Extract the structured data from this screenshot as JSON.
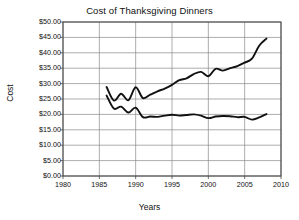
{
  "chart_data": {
    "type": "line",
    "title": "Cost of Thanksgiving Dinners",
    "xlabel": "Years",
    "ylabel": "Cost",
    "xlim": [
      1980,
      2010
    ],
    "ylim": [
      0,
      50
    ],
    "grid": true,
    "legend": "none",
    "xticks": [
      "1980",
      "1985",
      "1990",
      "1995",
      "2000",
      "2005",
      "2010"
    ],
    "xtick_values": [
      1980,
      1985,
      1990,
      1995,
      2000,
      2005,
      2010
    ],
    "yticks": [
      "$0.00",
      "$5.00",
      "$10.00",
      "$15.00",
      "$20.00",
      "$25.00",
      "$30.00",
      "$35.00",
      "$40.00",
      "$45.00",
      "$50.00"
    ],
    "ytick_values": [
      0,
      5,
      10,
      15,
      20,
      25,
      30,
      35,
      40,
      45,
      50
    ],
    "x": [
      1986,
      1987,
      1988,
      1989,
      1990,
      1991,
      1992,
      1993,
      1994,
      1995,
      1996,
      1997,
      1998,
      1999,
      2000,
      2001,
      2002,
      2003,
      2004,
      2005,
      2006,
      2007,
      2008
    ],
    "series": [
      {
        "name": "Nominal cost",
        "values": [
          28.9,
          24.5,
          26.7,
          24.6,
          28.8,
          25.3,
          26.4,
          27.5,
          28.4,
          29.6,
          31.1,
          31.7,
          33.1,
          33.8,
          32.4,
          34.8,
          34.2,
          35.0,
          35.7,
          36.8,
          38.1,
          42.3,
          44.6
        ]
      },
      {
        "name": "Inflation-adjusted cost",
        "values": [
          26.1,
          21.9,
          22.5,
          20.6,
          22.2,
          19.1,
          19.3,
          19.2,
          19.6,
          19.9,
          19.6,
          19.8,
          20.0,
          19.6,
          18.8,
          19.3,
          19.5,
          19.4,
          19.1,
          19.2,
          18.3,
          19.0,
          20.1
        ]
      }
    ]
  }
}
